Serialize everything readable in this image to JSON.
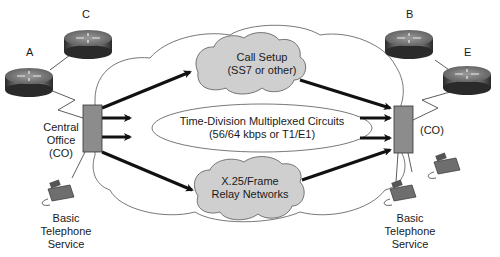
{
  "routers": [
    {
      "id": "A",
      "label": "A"
    },
    {
      "id": "C",
      "label": "C"
    },
    {
      "id": "B",
      "label": "B"
    },
    {
      "id": "E",
      "label": "E"
    }
  ],
  "left_site": {
    "co_label_line1": "Central",
    "co_label_line2": "Office",
    "co_label_line3": "(CO)",
    "phone_label_line1": "Basic",
    "phone_label_line2": "Telephone",
    "phone_label_line3": "Service"
  },
  "right_site": {
    "co_label": "(CO)",
    "phone_label_line1": "Basic",
    "phone_label_line2": "Telephone",
    "phone_label_line3": "Service"
  },
  "networks": {
    "call_setup": {
      "line1": "Call Setup",
      "line2": "(SS7 or other)"
    },
    "tdm": {
      "line1": "Time-Division Multiplexed Circuits",
      "line2": "(56/64 kbps or T1/E1)"
    },
    "x25": {
      "line1": "X.25/Frame",
      "line2": "Relay Networks"
    }
  },
  "colors": {
    "co_box": "#8c8c8c",
    "inner_cloud": "#cfcfcf",
    "outline": "#555555",
    "arrow": "#111111"
  }
}
